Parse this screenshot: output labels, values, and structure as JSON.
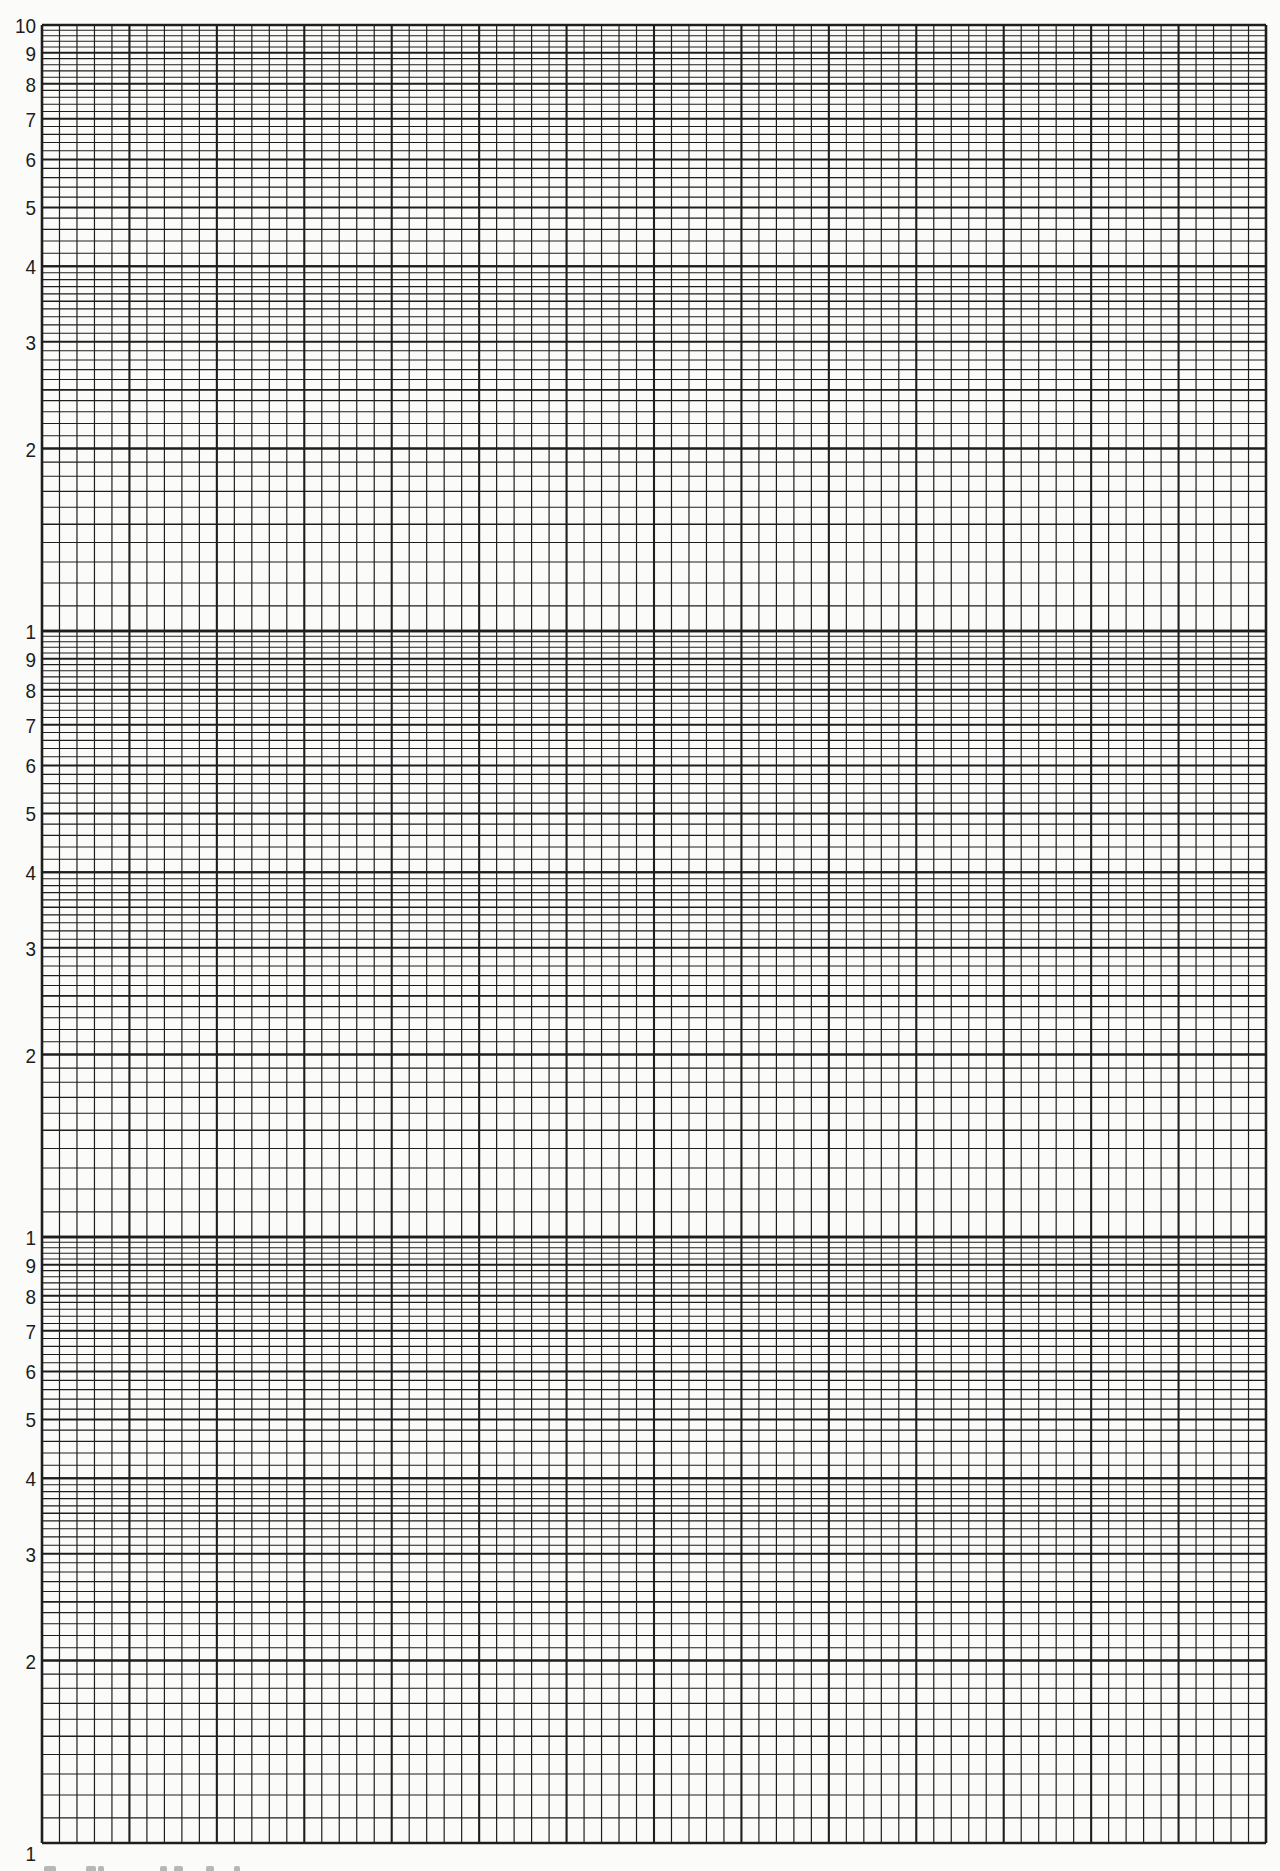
{
  "chart_data": {
    "type": "table",
    "title": "",
    "xlabel": "",
    "ylabel": "",
    "grid": true,
    "y_scale": "log",
    "y_cycles": 3,
    "y_axis_ticks_per_cycle": [
      "1",
      "2",
      "3",
      "4",
      "5",
      "6",
      "7",
      "8",
      "9",
      "10"
    ],
    "y_axis_tick_labels_top_to_bottom": [
      "10",
      "9",
      "8",
      "7",
      "6",
      "5",
      "4",
      "3",
      "2",
      "1",
      "9",
      "8",
      "7",
      "6",
      "5",
      "4",
      "3",
      "2",
      "1",
      "9",
      "8",
      "7",
      "6",
      "5",
      "4",
      "3",
      "2",
      "1"
    ],
    "x_scale": "linear",
    "x_major_divisions": 14,
    "x_minor_per_major": 5,
    "y_minor_steps": [
      {
        "from": 1,
        "to": 2,
        "step": 0.1
      },
      {
        "from": 2,
        "to": 4,
        "step": 0.1
      },
      {
        "from": 4,
        "to": 10,
        "step": 0.2
      }
    ],
    "series": []
  },
  "layout": {
    "grid_left": 42,
    "grid_top": 25,
    "grid_right": 1266,
    "grid_bottom": 1843,
    "line_color": "#1e1e1e",
    "paper_color": "#fbfbfa"
  },
  "labels": {
    "cycle_top": [
      "10",
      "9",
      "8",
      "7",
      "6",
      "5",
      "4",
      "3",
      "2"
    ],
    "cycle_mid": [
      "1",
      "9",
      "8",
      "7",
      "6",
      "5",
      "4",
      "3",
      "2"
    ],
    "cycle_bottom": [
      "1",
      "9",
      "8",
      "7",
      "6",
      "5",
      "4",
      "3",
      "2",
      "1"
    ]
  }
}
